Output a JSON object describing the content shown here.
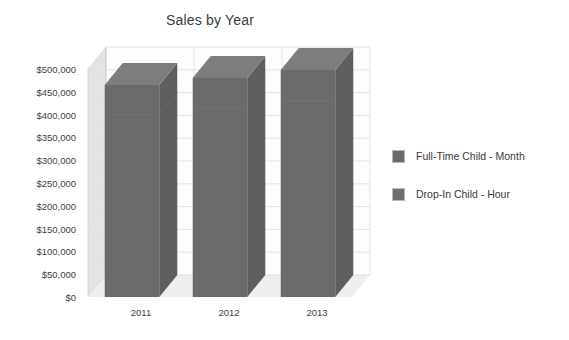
{
  "chart_data": {
    "type": "bar",
    "title": "Sales by Year",
    "xlabel": "",
    "ylabel": "",
    "categories": [
      "2011",
      "2012",
      "2013"
    ],
    "series": [
      {
        "name": "Full-Time Child - Month",
        "values": [
          400000,
          415000,
          430000
        ],
        "color": "#6b6b6b"
      },
      {
        "name": "Drop-In Child - Hour",
        "values": [
          65000,
          65000,
          68000
        ],
        "color": "#6e6e6e"
      }
    ],
    "totals": [
      465000,
      480000,
      498000
    ],
    "ylim": [
      0,
      500000
    ],
    "ytick_labels": [
      "$500,000",
      "$450,000",
      "$400,000",
      "$350,000",
      "$300,000",
      "$250,000",
      "$200,000",
      "$150,000",
      "$100,000",
      "$50,000",
      "$0"
    ],
    "ytick_values": [
      500000,
      450000,
      400000,
      350000,
      300000,
      250000,
      200000,
      150000,
      100000,
      50000,
      0
    ],
    "grid": true,
    "three_d": true,
    "stacked": true,
    "legend_position": "right",
    "colors": {
      "bar_front": "#6b6b6b",
      "bar_side": "#5e5e5e",
      "bar_top": "#7d7d7d",
      "wall": "#e3e3e3",
      "wall_edge": "#d2d2d2",
      "floor": "#efefef",
      "grid_line": "#d8d8d8",
      "text": "#3a3a3a",
      "background": "#ffffff"
    }
  },
  "legend": {
    "items": [
      {
        "label": "Full-Time Child - Month",
        "swatch": "#6b6b6b"
      },
      {
        "label": "Drop-In Child - Hour",
        "swatch": "#6e6e6e"
      }
    ]
  }
}
